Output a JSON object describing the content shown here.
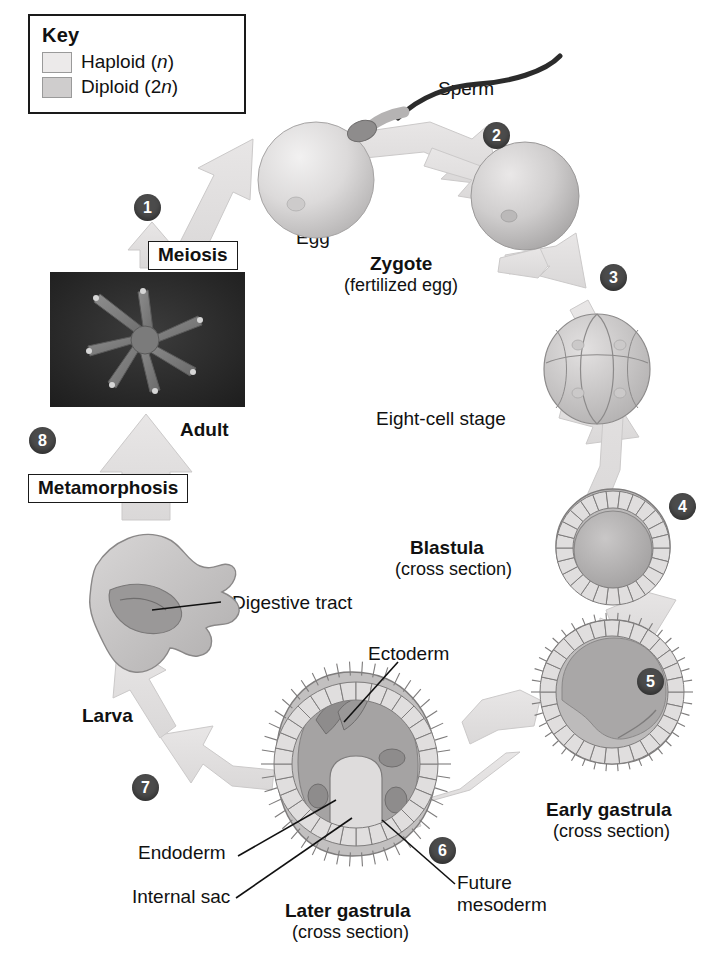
{
  "key": {
    "title": "Key",
    "entries": [
      {
        "label_main": "Haploid (",
        "label_italic": "n",
        "label_end": ")",
        "swatch": "haploid",
        "color": "#eceaea"
      },
      {
        "label_main": "Diploid (2",
        "label_italic": "n",
        "label_end": ")",
        "swatch": "diploid",
        "color": "#cfcdcd"
      }
    ]
  },
  "steps": {
    "s1": "1",
    "s2": "2",
    "s3": "3",
    "s4": "4",
    "s5": "5",
    "s6": "6",
    "s7": "7",
    "s8": "8"
  },
  "labels": {
    "sperm": "Sperm",
    "egg": "Egg",
    "meiosis": "Meiosis",
    "zygote": "Zygote",
    "zygote_sub": "(fertilized egg)",
    "eight_cell": "Eight-cell stage",
    "blastula": "Blastula",
    "blastula_sub": "(cross section)",
    "early_gastrula": "Early gastrula",
    "early_gastrula_sub": "(cross section)",
    "later_gastrula": "Later gastrula",
    "later_gastrula_sub": "(cross section)",
    "ectoderm": "Ectoderm",
    "endoderm": "Endoderm",
    "internal_sac": "Internal sac",
    "future_mesoderm_line1": "Future",
    "future_mesoderm_line2": "mesoderm",
    "larva": "Larva",
    "digestive_tract": "Digestive tract",
    "metamorphosis": "Metamorphosis",
    "adult": "Adult"
  },
  "colors": {
    "haploid": "#eceaea",
    "diploid": "#cfcdcd",
    "arrow_fill": "#e2e0e0",
    "arrow_stroke": "#c8c6c6",
    "step_circle": "#4b4b4b",
    "text": "#111111",
    "photo_bg": "#2a2a2a"
  }
}
